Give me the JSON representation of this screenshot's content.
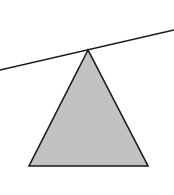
{
  "diagram": {
    "background": "#ffffff",
    "lever": {
      "x1": 0,
      "y1": 70,
      "x2": 174,
      "y2": 30,
      "stroke": "#1a1a1a",
      "stroke_width": 1.6
    },
    "fulcrum": {
      "apex": [
        88,
        50
      ],
      "base_left": [
        29,
        166
      ],
      "base_right": [
        148,
        166
      ],
      "fill": "#c2c2c2",
      "stroke": "#1a1a1a",
      "stroke_width": 1.6
    }
  }
}
